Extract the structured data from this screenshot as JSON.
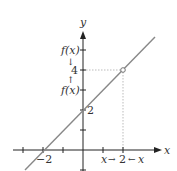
{
  "figure": {
    "axes": {
      "x_label": "x",
      "y_label": "y",
      "x_ticks": [
        -3,
        -2,
        -1,
        1,
        2
      ],
      "y_ticks": [
        -1,
        1,
        2,
        3,
        4,
        5
      ],
      "x_tick_labels": {
        "neg2": "−2",
        "pos2": "2"
      },
      "y_tick_labels": {
        "two": "2",
        "four": "4"
      }
    },
    "line": {
      "equation": "y = x + 2",
      "color": "#888888"
    },
    "hole_point": {
      "x": 2,
      "y": 4
    },
    "annotations": {
      "fx_upper": "f(x)",
      "fx_lower": "f(x)",
      "arrow_down": "↓",
      "arrow_up": "↑",
      "x_left": "x",
      "x_right": "x",
      "arrow_right": "→",
      "arrow_left": "←"
    },
    "colors": {
      "axis": "#222222",
      "line": "#888888",
      "dotted_guide": "#aaaaaa"
    }
  }
}
